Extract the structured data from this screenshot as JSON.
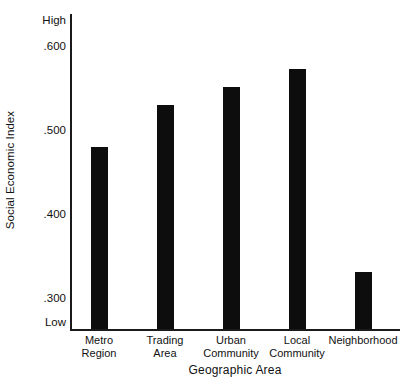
{
  "chart_data": {
    "type": "bar",
    "title": "",
    "xlabel": "Geographic Area",
    "ylabel": "Social Economic Index",
    "categories": [
      "Metro Region",
      "Trading Area",
      "Urban Community",
      "Local Community",
      "Neighborhood"
    ],
    "category_lines": [
      [
        "Metro",
        "Region"
      ],
      [
        "Trading",
        "Area"
      ],
      [
        "Urban",
        "Community"
      ],
      [
        "Local",
        "Community"
      ],
      [
        "Neighborhood",
        ""
      ]
    ],
    "values": [
      0.478,
      0.528,
      0.55,
      0.571,
      0.33
    ],
    "ylim": [
      0.262,
      0.638
    ],
    "ytick_values": [
      0.6,
      0.5,
      0.4,
      0.3
    ],
    "ytick_labels": [
      ".600",
      ".500",
      ".400",
      ".300"
    ],
    "y_axis_end_labels": {
      "high": "High",
      "low": "Low"
    },
    "grid": false,
    "legend": false,
    "bar_color": "#0d0d0d",
    "axis_color": "#1a1a1a",
    "background_color": "#ffffff"
  }
}
